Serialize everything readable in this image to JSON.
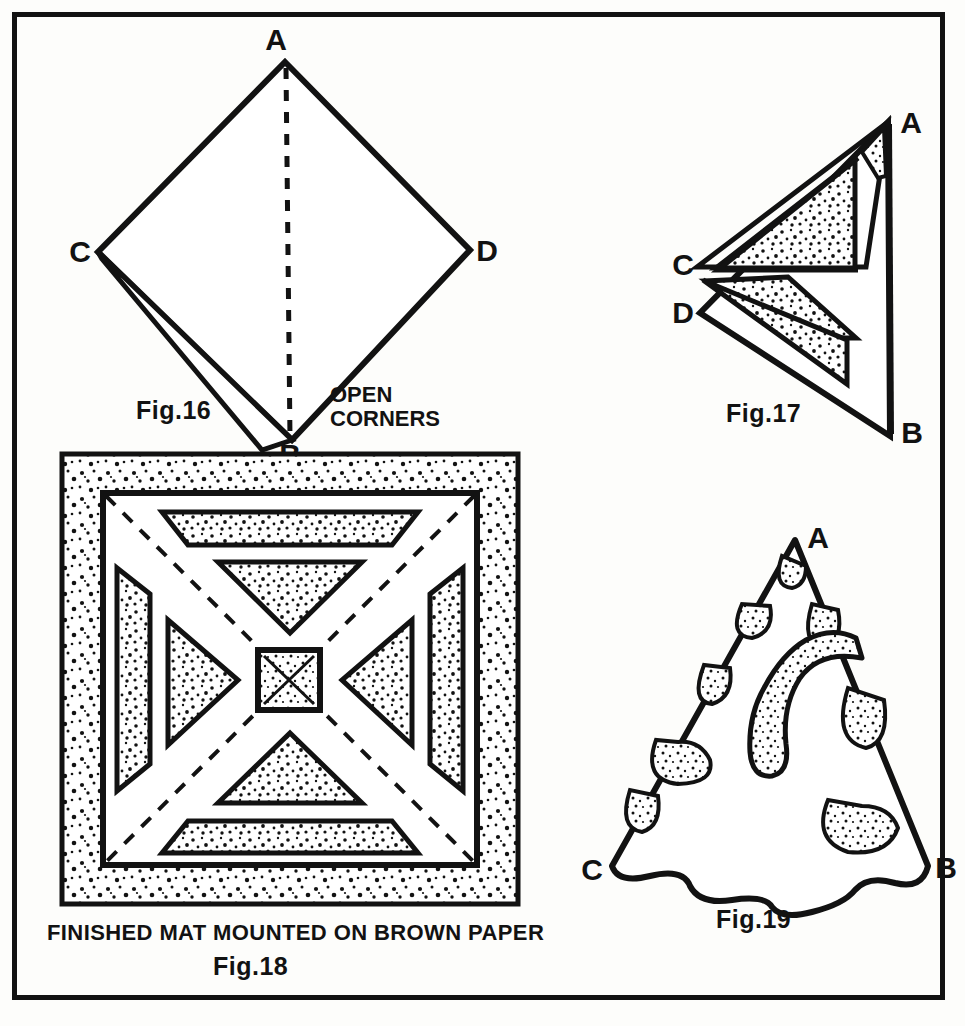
{
  "page": {
    "background_color": "#fdfdfb",
    "ink_color": "#121212",
    "frame": {
      "x": 12,
      "y": 12,
      "width": 933,
      "height": 988,
      "stroke_width": 5
    }
  },
  "figures": [
    {
      "id": "fig16",
      "caption": "Fig.16",
      "annotation": "OPEN",
      "annotation_line2": "CORNERS",
      "points": [
        {
          "label": "A",
          "x": 285,
          "y": 62
        },
        {
          "label": "C",
          "x": 98,
          "y": 252
        },
        {
          "label": "D",
          "x": 470,
          "y": 250
        },
        {
          "label": "B",
          "x": 292,
          "y": 440
        }
      ],
      "description": "Folded square diamond with dashed centre fold and an open flap at corner B"
    },
    {
      "id": "fig17",
      "caption": "Fig.17",
      "points": [
        {
          "label": "A",
          "x": 890,
          "y": 128
        },
        {
          "label": "C",
          "x": 700,
          "y": 268
        },
        {
          "label": "D",
          "x": 700,
          "y": 318
        },
        {
          "label": "B",
          "x": 890,
          "y": 430
        }
      ],
      "description": "Folded triangle with two stippled cut bands and a small stippled tip"
    },
    {
      "id": "fig18",
      "caption": "Fig.18",
      "subcaption": "FINISHED MAT MOUNTED ON BROWN PAPER",
      "description": "Square mat with stippled border, four triangular and four trapezoidal stippled cut-outs, dashed diagonals and a small stippled centre square"
    },
    {
      "id": "fig19",
      "caption": "Fig.19",
      "points": [
        {
          "label": "A",
          "x": 795,
          "y": 540
        },
        {
          "label": "C",
          "x": 612,
          "y": 871
        },
        {
          "label": "B",
          "x": 928,
          "y": 868
        }
      ],
      "description": "Cone-shaped folded wedge with scalloped bottom edge and stippled cut shapes"
    }
  ],
  "labels": {
    "fig16": "Fig.16",
    "fig17": "Fig.17",
    "fig18": "Fig.18",
    "fig19": "Fig.19",
    "open": "OPEN",
    "corners": "CORNERS",
    "mat_caption": "FINISHED MAT MOUNTED ON BROWN PAPER",
    "A": "A",
    "B": "B",
    "C": "C",
    "D": "D",
    "bottom_cropped": "",
    "fig16_A": "A",
    "fig16_B": "B",
    "fig16_C": "C",
    "fig16_D": "D",
    "fig17_A": "A",
    "fig17_B": "B",
    "fig17_C": "C",
    "fig17_D": "D",
    "fig19_A": "A",
    "fig19_B": "B",
    "fig19_C": "C"
  }
}
